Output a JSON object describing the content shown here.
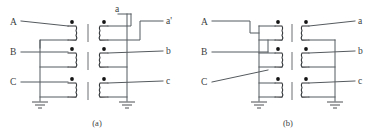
{
  "figure": {
    "type": "electrical-schematic",
    "background_color": "#ffffff",
    "wire_color": "#555a5e",
    "coil_color": "#2e3134",
    "text_color": "#3a3d40",
    "panels": [
      {
        "id": "a",
        "caption": "(a)",
        "caption_x": 97,
        "caption_y": 126,
        "primary_terminals": [
          {
            "label": "A",
            "x": 10,
            "y": 25
          },
          {
            "label": "B",
            "x": 10,
            "y": 55
          },
          {
            "label": "C",
            "x": 10,
            "y": 85
          }
        ],
        "secondary_terminals": [
          {
            "label": "a",
            "x": 118,
            "y": 13
          },
          {
            "label": "a'",
            "x": 168,
            "y": 24
          },
          {
            "label": "b",
            "x": 168,
            "y": 54
          },
          {
            "label": "c",
            "x": 168,
            "y": 84
          }
        ],
        "grounds": [
          {
            "x": 40,
            "y": 104
          },
          {
            "x": 127,
            "y": 104
          }
        ],
        "coil_pairs": 3,
        "coil_rows_y": [
          25,
          55,
          85
        ],
        "left_coil_x": 77,
        "right_coil_x": 103,
        "core_x": 90,
        "dots": [
          {
            "x": 73,
            "y": 20
          },
          {
            "x": 107,
            "y": 20
          },
          {
            "x": 73,
            "y": 50
          },
          {
            "x": 107,
            "y": 50
          },
          {
            "x": 73,
            "y": 80
          },
          {
            "x": 107,
            "y": 80
          }
        ]
      },
      {
        "id": "b",
        "caption": "(b)",
        "caption_x": 288,
        "caption_y": 126,
        "primary_terminals": [
          {
            "label": "A",
            "x": 201,
            "y": 25
          },
          {
            "label": "B",
            "x": 201,
            "y": 55
          },
          {
            "label": "C",
            "x": 201,
            "y": 85
          }
        ],
        "secondary_terminals": [
          {
            "label": "a",
            "x": 359,
            "y": 24
          },
          {
            "label": "b",
            "x": 359,
            "y": 54
          },
          {
            "label": "c",
            "x": 359,
            "y": 84
          }
        ],
        "grounds": [
          {
            "x": 259,
            "y": 104
          },
          {
            "x": 335,
            "y": 104
          }
        ],
        "coil_pairs": 3,
        "coil_rows_y": [
          25,
          55,
          85
        ],
        "left_coil_x": 283,
        "right_coil_x": 300,
        "core_x": 292,
        "dots": [
          {
            "x": 274,
            "y": 20
          },
          {
            "x": 308,
            "y": 20
          },
          {
            "x": 274,
            "y": 50
          },
          {
            "x": 308,
            "y": 50
          },
          {
            "x": 274,
            "y": 80
          },
          {
            "x": 308,
            "y": 80
          }
        ]
      }
    ]
  }
}
